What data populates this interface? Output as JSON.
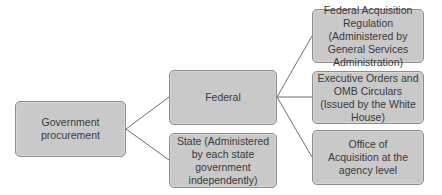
{
  "diagram": {
    "type": "tree",
    "root": {
      "id": "government-procurement",
      "label": "Government procurement",
      "lines": [
        "Government",
        "procurement"
      ]
    },
    "level1": [
      {
        "id": "federal",
        "label": "Federal"
      },
      {
        "id": "state",
        "label": "State (Administered by each state government independently)"
      }
    ],
    "level2": [
      {
        "id": "far",
        "parent": "federal",
        "label": "Federal Acquisition Regulation (Administered by General Services Administration)"
      },
      {
        "id": "executive-orders",
        "parent": "federal",
        "label": "Executive Orders and OMB Circulars (Issued by the White House)"
      },
      {
        "id": "office-of-acquisition",
        "parent": "federal",
        "label": "Office of Acquisition at the agency level"
      }
    ],
    "edges": [
      [
        "government-procurement",
        "federal"
      ],
      [
        "government-procurement",
        "state"
      ],
      [
        "federal",
        "far"
      ],
      [
        "federal",
        "executive-orders"
      ],
      [
        "federal",
        "office-of-acquisition"
      ]
    ],
    "colors": {
      "node_fill": "#c9c9c9",
      "node_border": "#8c8c8c",
      "text": "#3a3a3a",
      "connector": "#6e6e6e"
    }
  }
}
